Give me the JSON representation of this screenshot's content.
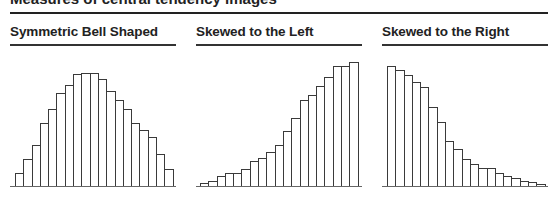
{
  "header": {
    "title": "Measures of central tendency images"
  },
  "panels": [
    {
      "title": "Symmetric Bell Shaped"
    },
    {
      "title": "Skewed to the Left"
    },
    {
      "title": "Skewed to the Right"
    }
  ],
  "colors": {
    "bar_fill": "#ffffff",
    "bar_stroke": "#3a3a3a",
    "rule": "#222222",
    "text": "#222222"
  },
  "chart_data": [
    {
      "type": "bar",
      "title": "Symmetric Bell Shaped",
      "xlabel": "",
      "ylabel": "",
      "categories": [
        "1",
        "2",
        "3",
        "4",
        "5",
        "6",
        "7",
        "8",
        "9",
        "10",
        "11",
        "12",
        "13",
        "14",
        "15",
        "16",
        "17",
        "18",
        "19"
      ],
      "values": [
        13,
        27,
        41,
        63,
        77,
        93,
        101,
        112,
        113,
        113,
        107,
        95,
        86,
        77,
        63,
        56,
        49,
        32,
        17
      ],
      "ylim": [
        0,
        126
      ],
      "grid": false,
      "legend": null
    },
    {
      "type": "bar",
      "title": "Skewed to the Left",
      "xlabel": "",
      "ylabel": "",
      "categories": [
        "1",
        "2",
        "3",
        "4",
        "5",
        "6",
        "7",
        "8",
        "9",
        "10",
        "11",
        "12",
        "13",
        "14",
        "15",
        "16",
        "17",
        "18",
        "19"
      ],
      "values": [
        3,
        5,
        10,
        13,
        13,
        17,
        25,
        28,
        34,
        41,
        55,
        68,
        86,
        91,
        100,
        109,
        120,
        120,
        124
      ],
      "ylim": [
        0,
        126
      ],
      "grid": false,
      "legend": null
    },
    {
      "type": "bar",
      "title": "Skewed to the Right",
      "xlabel": "",
      "ylabel": "",
      "categories": [
        "1",
        "2",
        "3",
        "4",
        "5",
        "6",
        "7",
        "8",
        "9",
        "10",
        "11",
        "12",
        "13",
        "14",
        "15",
        "16",
        "17",
        "18",
        "19"
      ],
      "values": [
        120,
        116,
        111,
        104,
        99,
        79,
        64,
        45,
        37,
        27,
        22,
        18,
        18,
        13,
        10,
        8,
        5,
        4,
        2
      ],
      "ylim": [
        0,
        126
      ],
      "grid": false,
      "legend": null
    }
  ]
}
